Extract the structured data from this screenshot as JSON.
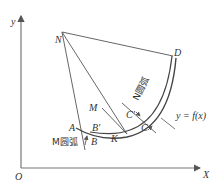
{
  "axes": {
    "x_label": "X",
    "y_label": "y",
    "origin_label": "O"
  },
  "points": {
    "N": "N",
    "D": "D",
    "M": "M",
    "A": "A",
    "B_prime": "B′",
    "B": "B",
    "K": "K",
    "C_prime": "C′",
    "C": "C"
  },
  "arcs": {
    "m_arc": "M圆弧",
    "n_arc": "N圆弧"
  },
  "curve_label": "y = f(x)",
  "colors": {
    "stroke": "#555555",
    "text": "#333333"
  }
}
